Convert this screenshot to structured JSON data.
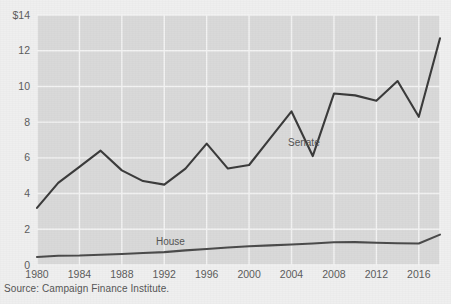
{
  "figure": {
    "background_color": "#efefef",
    "plot_background_color": "#d9d9d9",
    "gridline_color": "#f2f2f2",
    "line_color": "#3a3a3a",
    "tick_label_color": "#5b5b5b"
  },
  "source": {
    "text": "Source: Campaign Finance Institute."
  },
  "labels": {
    "senate": "Senate",
    "house": "House"
  },
  "axis": {
    "y_ticks": [
      "$14",
      "12",
      "10",
      "8",
      "6",
      "4",
      "2",
      "0"
    ],
    "y_tick_values": [
      14,
      12,
      10,
      8,
      6,
      4,
      2,
      0
    ],
    "x_ticks": [
      "1980",
      "1984",
      "1988",
      "1992",
      "1996",
      "2000",
      "2004",
      "2008",
      "2012",
      "2016"
    ],
    "x_tick_values": [
      1980,
      1984,
      1988,
      1992,
      1996,
      2000,
      2004,
      2008,
      2012,
      2016
    ]
  },
  "chart_data": {
    "type": "line",
    "title": "",
    "subtitle": "",
    "xlabel": "",
    "ylabel": "",
    "xlim": [
      1980,
      2018
    ],
    "ylim": [
      0,
      14
    ],
    "grid": true,
    "legend": "inline-labels",
    "x": [
      1980,
      1982,
      1984,
      1986,
      1988,
      1990,
      1992,
      1994,
      1996,
      1998,
      2000,
      2002,
      2004,
      2006,
      2008,
      2010,
      2012,
      2014,
      2016,
      2018
    ],
    "series": [
      {
        "name": "Senate",
        "color": "#3a3a3a",
        "values": [
          3.2,
          4.6,
          5.5,
          6.4,
          5.3,
          4.7,
          4.5,
          5.4,
          6.8,
          5.4,
          5.6,
          7.1,
          8.6,
          6.1,
          9.6,
          9.5,
          9.2,
          10.3,
          8.3,
          12.7
        ]
      },
      {
        "name": "House",
        "color": "#4a4a4a",
        "values": [
          0.45,
          0.52,
          0.53,
          0.57,
          0.62,
          0.67,
          0.72,
          0.82,
          0.9,
          0.98,
          1.05,
          1.1,
          1.15,
          1.2,
          1.27,
          1.28,
          1.25,
          1.22,
          1.2,
          1.7
        ]
      }
    ]
  }
}
